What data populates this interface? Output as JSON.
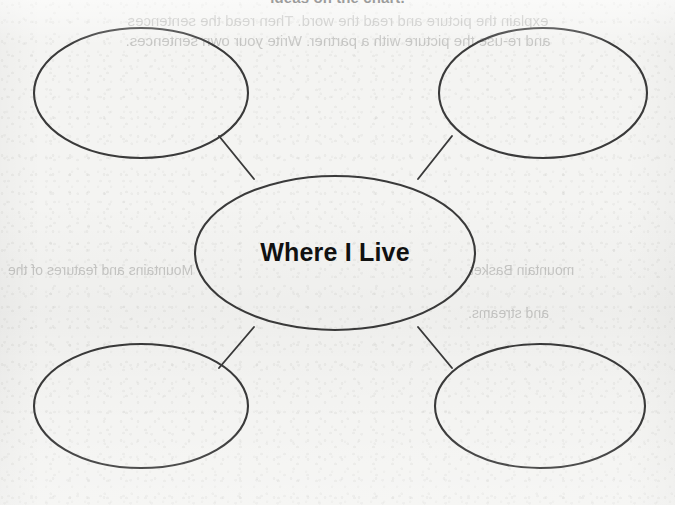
{
  "worksheet": {
    "heading": "ideas on the chart.",
    "bleed_through_lines": [
      "explain the picture and read the word. Then read the sentences",
      "and re-use the picture with a partner. Write your own sentences.",
      "Mountains and features of the",
      "mountain Basket",
      "and streams."
    ]
  },
  "diagram": {
    "type": "bubble-web",
    "center": {
      "label": "Where I Live",
      "cx": 335,
      "cy": 253,
      "rx": 140,
      "ry": 77
    },
    "ink_color": "#3a3a3a",
    "text_color": "#111111",
    "paper_color": "#f4f4f2",
    "nodes": [
      {
        "id": "top-left",
        "label": "",
        "cx": 141,
        "cy": 93,
        "rx": 107,
        "ry": 65
      },
      {
        "id": "top-right",
        "label": "",
        "cx": 543,
        "cy": 93,
        "rx": 104,
        "ry": 65
      },
      {
        "id": "bottom-left",
        "label": "",
        "cx": 141,
        "cy": 406,
        "rx": 107,
        "ry": 62
      },
      {
        "id": "bottom-right",
        "label": "",
        "cx": 540,
        "cy": 406,
        "rx": 105,
        "ry": 62
      }
    ],
    "connectors": [
      {
        "from": "top-left",
        "to": "center",
        "x1": 219,
        "y1": 136,
        "x2": 254,
        "y2": 179
      },
      {
        "from": "top-right",
        "to": "center",
        "x1": 452,
        "y1": 136,
        "x2": 418,
        "y2": 179
      },
      {
        "from": "bottom-left",
        "to": "center",
        "x1": 219,
        "y1": 368,
        "x2": 254,
        "y2": 327
      },
      {
        "from": "bottom-right",
        "to": "center",
        "x1": 452,
        "y1": 368,
        "x2": 418,
        "y2": 327
      }
    ]
  }
}
